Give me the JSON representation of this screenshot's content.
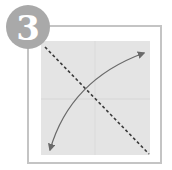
{
  "step": {
    "number": "3"
  },
  "colors": {
    "circle": "#a9a9a9",
    "frame_border": "#c4c4c4",
    "paper": "#e4e4e4",
    "crease": "#d8d8d8",
    "fold_line": "#3a3a3a",
    "arrow": "#6a6a6a"
  },
  "diagram": {
    "fold_line": {
      "style": "dashed",
      "from": "top-left",
      "to": "bottom-right"
    },
    "arrow": {
      "style": "curved",
      "heads": "both",
      "from": "top-right",
      "to": "bottom-left"
    },
    "creases": [
      "horizontal-center",
      "vertical-center"
    ]
  }
}
